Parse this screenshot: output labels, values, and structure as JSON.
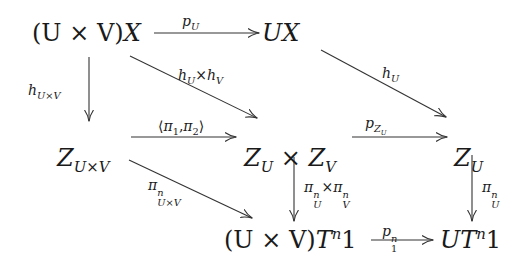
{
  "diagram": {
    "type": "commutative-diagram",
    "colors": {
      "stroke": "#333333",
      "text": "#1a1a1a",
      "background": "#ffffff"
    },
    "nodes": {
      "uxv_x": {
        "pre": "(U × V)",
        "main": "X",
        "latex": "(U \\times V)X"
      },
      "ux": {
        "main": "UX",
        "latex": "UX"
      },
      "z_uxv": {
        "main": "Z",
        "sub": "U×V",
        "latex": "Z_{U\\times V}"
      },
      "zu_x_zv": {
        "a": "Z",
        "a_sub": "U",
        "op": " × ",
        "b": "Z",
        "b_sub": "V",
        "latex": "Z_U \\times Z_V"
      },
      "zu": {
        "main": "Z",
        "sub": "U",
        "latex": "Z_U"
      },
      "uxv_tn1": {
        "pre": "(U × V)",
        "t": "T",
        "sup": "n",
        "post": "1",
        "latex": "(U \\times V)T^n 1"
      },
      "u_tn1": {
        "pre": "U",
        "t": "T",
        "sup": "n",
        "post": "1",
        "latex": "UT^n 1"
      }
    },
    "arrows": {
      "p_u": {
        "from": "(U × V)X",
        "to": "UX",
        "label_main": "p",
        "label_sub": "U",
        "latex": "p_U"
      },
      "h_uxv": {
        "from": "(U × V)X",
        "to": "Z_{U×V}",
        "label_main": "h",
        "label_sub": "U×V",
        "latex": "h_{U\\times V}"
      },
      "hu_x_hv": {
        "from": "(U × V)X",
        "to": "Z_U × Z_V",
        "a": "h",
        "a_sub": "U",
        "op": "×",
        "b": "h",
        "b_sub": "V",
        "latex": "h_U \\times h_V"
      },
      "h_u": {
        "from": "UX",
        "to": "Z_U",
        "label_main": "h",
        "label_sub": "U",
        "latex": "h_U"
      },
      "pi12": {
        "from": "Z_{U×V}",
        "to": "Z_U × Z_V",
        "label": "⟨π₁,π₂⟩",
        "l": "⟨",
        "p1": "π",
        "p1_sub": "1",
        "comma": ",",
        "p2": "π",
        "p2_sub": "2",
        "r": "⟩",
        "latex": "\\langle \\pi_1, \\pi_2 \\rangle"
      },
      "p_zu": {
        "from": "Z_U × Z_V",
        "to": "Z_U",
        "label_main": "p",
        "label_sub": "Z",
        "label_subsub": "U",
        "latex": "p_{Z_U}"
      },
      "pi_n_uxv": {
        "from": "Z_{U×V}",
        "to": "(U × V)T^n1",
        "label_main": "π",
        "label_sup": "n",
        "label_sub": "U×V",
        "latex": "\\pi^n_{U\\times V}"
      },
      "pi_nu_x_pi_nv": {
        "from": "Z_U × Z_V",
        "to": "(U × V)T^n1",
        "a": "π",
        "a_sup": "n",
        "a_sub": "U",
        "op": "×",
        "b": "π",
        "b_sup": "n",
        "b_sub": "V",
        "latex": "\\pi^n_U \\times \\pi^n_V"
      },
      "pi_n_u": {
        "from": "Z_U",
        "to": "UT^n1",
        "label_main": "π",
        "label_sup": "n",
        "label_sub": "U",
        "latex": "\\pi^n_U"
      },
      "p1_n": {
        "from": "(U × V)T^n1",
        "to": "UT^n1",
        "label_main": "p",
        "label_sup": "n",
        "label_sub": "1",
        "latex": "p^n_1"
      }
    }
  }
}
